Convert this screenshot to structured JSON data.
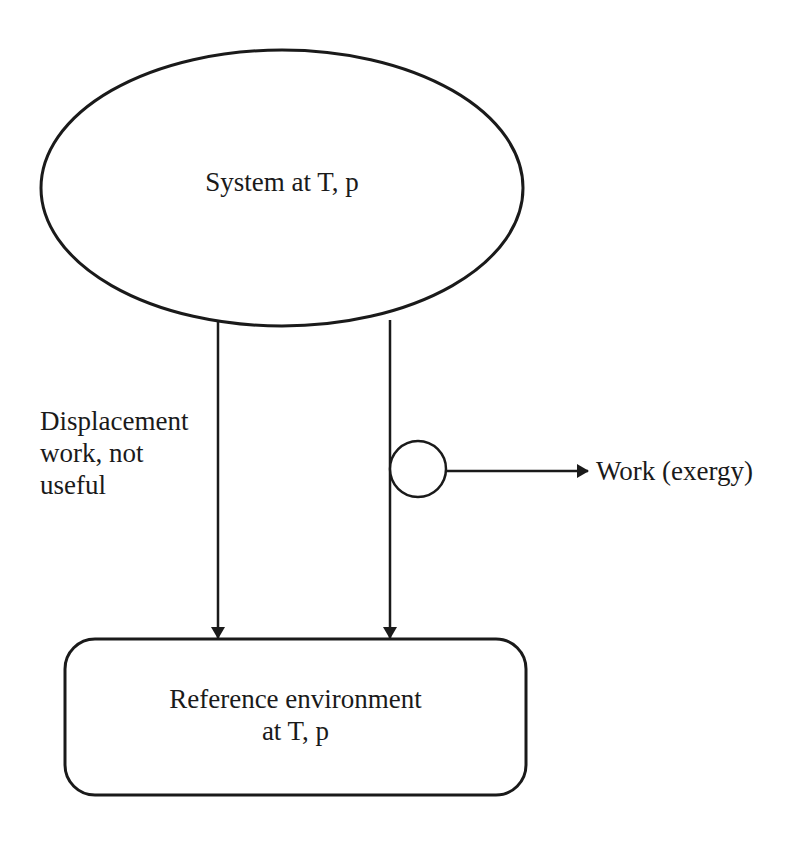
{
  "diagram": {
    "system": {
      "label": "System at T, p",
      "shape": "ellipse"
    },
    "displacement": {
      "line1": "Displacement",
      "line2": "work, not",
      "line3": "useful"
    },
    "work_output": {
      "label": "Work (exergy)",
      "device_shape": "circle"
    },
    "environment": {
      "line1": "Reference environment",
      "line2": "at T, p",
      "shape": "rounded-rectangle"
    },
    "colors": {
      "stroke": "#1a1a1a",
      "background": "#ffffff"
    }
  }
}
